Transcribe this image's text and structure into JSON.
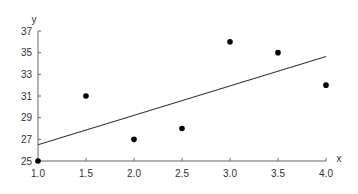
{
  "chart_data": {
    "type": "scatter",
    "title": "",
    "xlabel": "x",
    "ylabel": "y",
    "xlim": [
      1.0,
      4.0
    ],
    "ylim": [
      25,
      37
    ],
    "grid": false,
    "legend": null,
    "x_ticks": [
      "1.0",
      "1.5",
      "2.0",
      "2.5",
      "3.0",
      "3.5",
      "4.0"
    ],
    "y_ticks": [
      "25",
      "27",
      "29",
      "31",
      "33",
      "35",
      "37"
    ],
    "series": [
      {
        "name": "data",
        "type": "scatter",
        "x": [
          1.0,
          1.5,
          2.0,
          2.5,
          3.0,
          3.5,
          4.0
        ],
        "y": [
          25,
          31,
          27,
          28,
          36,
          35,
          32
        ]
      },
      {
        "name": "trend line",
        "type": "line",
        "x": [
          1.0,
          4.0
        ],
        "y": [
          26.5,
          34.64
        ]
      }
    ],
    "colors": {
      "points": "#000000",
      "line": "#333333",
      "axis": "#666666"
    }
  }
}
